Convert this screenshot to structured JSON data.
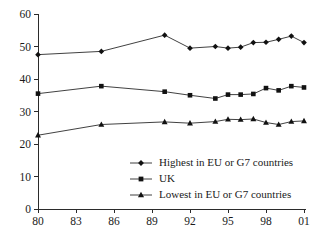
{
  "chart_data": {
    "type": "line",
    "title": "",
    "subtitle": "",
    "xlabel": "",
    "ylabel": "",
    "xlim": [
      1980,
      2001
    ],
    "ylim": [
      0,
      60
    ],
    "grid": false,
    "legend_position": "inside lower-right",
    "y_ticks": [
      0,
      10,
      20,
      30,
      40,
      50,
      60
    ],
    "y_tick_labels": [
      "0",
      "10",
      "20",
      "30",
      "40",
      "50",
      "60"
    ],
    "x_ticks": [
      1980,
      1983,
      1986,
      1989,
      1992,
      1995,
      1998,
      2001
    ],
    "x_tick_labels": [
      "80",
      "83",
      "86",
      "89",
      "92",
      "95",
      "98",
      "01"
    ],
    "x": [
      1980,
      1985,
      1990,
      1992,
      1994,
      1995,
      1996,
      1997,
      1998,
      1999,
      2000,
      2001
    ],
    "series": [
      {
        "name": "Highest in EU or G7 countries",
        "marker": "diamond",
        "values": [
          47.5,
          48.5,
          53.5,
          49.5,
          50.0,
          49.5,
          49.8,
          51.2,
          51.3,
          52.2,
          53.2,
          51.2
        ]
      },
      {
        "name": "UK",
        "marker": "square",
        "values": [
          35.5,
          37.8,
          36.1,
          35.0,
          34.0,
          35.2,
          35.2,
          35.4,
          37.2,
          36.5,
          37.8,
          37.4
        ]
      },
      {
        "name": "Lowest in EU or G7 countries",
        "marker": "triangle",
        "values": [
          22.7,
          26.0,
          26.8,
          26.4,
          26.9,
          27.6,
          27.5,
          27.7,
          26.6,
          26.0,
          26.9,
          27.1
        ]
      }
    ]
  },
  "legend": {
    "entries": [
      {
        "label": "Highest in EU or G7 countries",
        "marker": "diamond"
      },
      {
        "label": "UK",
        "marker": "square"
      },
      {
        "label": "Lowest in EU or G7 countries",
        "marker": "triangle"
      }
    ]
  },
  "colors": {
    "line": "#2b2b2b",
    "marker": "#111111",
    "axis": "#2b2b2b",
    "text": "#1a1a1a",
    "background": "#ffffff"
  }
}
